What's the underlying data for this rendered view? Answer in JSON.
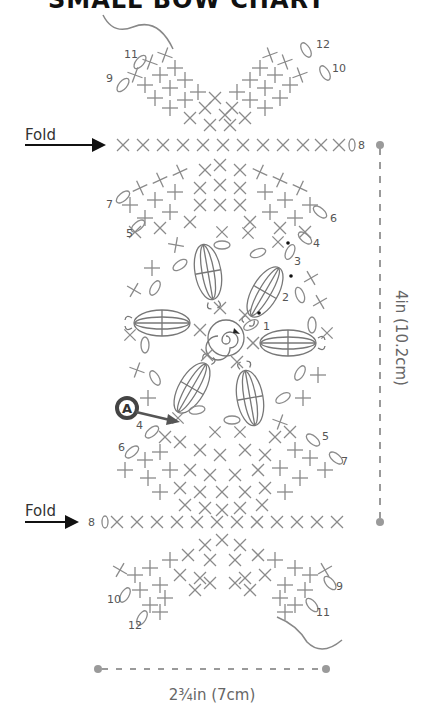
{
  "title": "SMALL BOW CHART",
  "fold_labels": {
    "top": "Fold",
    "bottom": "Fold"
  },
  "dimensions": {
    "height": "4in (10.2cm)",
    "width": "2¾in (7cm)"
  },
  "callout": {
    "letter": "A",
    "row": "4"
  },
  "round_numbers": {
    "center": [
      "1",
      "2",
      "3",
      "4"
    ],
    "upper_fan": [
      "5",
      "6",
      "7"
    ],
    "lower_fan": [
      "4",
      "5",
      "6",
      "7"
    ],
    "fold_rows": [
      "8",
      "8"
    ],
    "top_tail": [
      "9",
      "10",
      "11",
      "12"
    ],
    "bottom_tail": [
      "9",
      "10",
      "11",
      "12"
    ]
  },
  "fold_row_stitch_count": 12,
  "colors": {
    "stitch": "#8a8a8a",
    "ink": "#555555",
    "arrow": "#111111",
    "dimension": "#9a9a9a",
    "callout": "#444444"
  }
}
